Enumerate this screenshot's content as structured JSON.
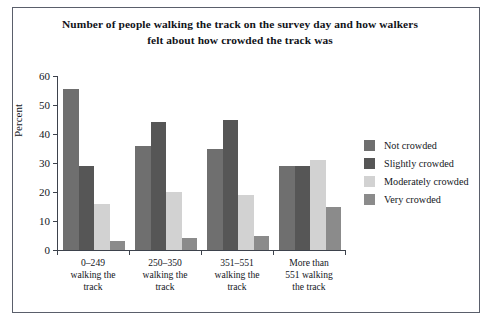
{
  "chart_data": {
    "type": "bar",
    "title": "Number of people walking the track on the survey day and how walkers felt about how crowded the track was",
    "title_line1": "Number of people walking the track on the survey day and how walkers",
    "title_line2": "felt about how crowded the track was",
    "xlabel": "",
    "ylabel": "Percent",
    "ylim": [
      0,
      60
    ],
    "yticks": [
      0,
      10,
      20,
      30,
      40,
      50,
      60
    ],
    "grid": false,
    "legend_position": "right",
    "categories": [
      "0–249 walking the track",
      "250–350 walking the track",
      "351–551 walking the track",
      "More than 551 walking the track"
    ],
    "category_lines": [
      [
        "0–249",
        "walking the",
        "track"
      ],
      [
        "250–350",
        "walking the",
        "track"
      ],
      [
        "351–551",
        "walking the",
        "track"
      ],
      [
        "More than",
        "551 walking",
        "the track"
      ]
    ],
    "series": [
      {
        "name": "Not crowded",
        "color": "#6f6f6f",
        "values": [
          55.5,
          36,
          35,
          29
        ]
      },
      {
        "name": "Slightly crowded",
        "color": "#565656",
        "values": [
          29,
          44,
          45,
          29
        ]
      },
      {
        "name": "Moderately crowded",
        "color": "#d2d2d2",
        "values": [
          16,
          20,
          19,
          31
        ]
      },
      {
        "name": "Very crowded",
        "color": "#8b8b8b",
        "values": [
          3,
          4,
          5,
          15
        ]
      }
    ]
  },
  "legend": {
    "items": [
      {
        "label": "Not crowded"
      },
      {
        "label": "Slightly crowded"
      },
      {
        "label": "Moderately crowded"
      },
      {
        "label": "Very crowded"
      }
    ]
  }
}
